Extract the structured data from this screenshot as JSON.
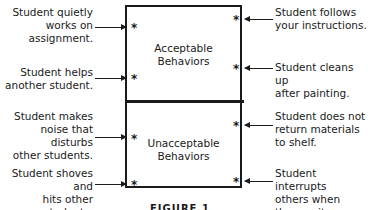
{
  "diagram": {
    "acceptable_label": "Acceptable\nBehaviors",
    "unacceptable_label": "Unacceptable\nBehaviors",
    "marker": "*",
    "left_notes": [
      "Student quietly\nworks on\nassignment.",
      "Student helps\nanother student.",
      "Student makes\nnoise that disturbs\nother students.",
      "Student shoves and\nhits other students."
    ],
    "right_notes": [
      "Student follows\nyour instructions.",
      "Student cleans up\nafter painting.",
      "Student does not\nreturn materials\nto shelf.",
      "Student interrupts\nothers when\nthey recite."
    ],
    "caption": "FIGURE 1"
  }
}
